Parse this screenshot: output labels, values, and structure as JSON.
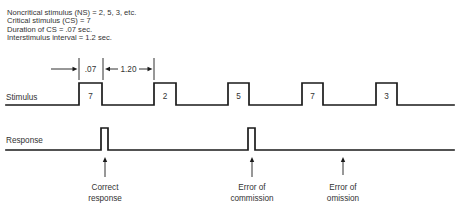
{
  "header": {
    "lines": [
      "Noncritical stimulus (NS) = 2, 5, 3, etc.",
      "Critical stimulus (CS) = 7",
      "Duration of CS = .07 sec.",
      "Interstimulus interval = 1.2 sec."
    ]
  },
  "timing": {
    "duration_label": ".07",
    "interval_label": "1.20"
  },
  "stimulus": {
    "label": "Stimulus",
    "values": [
      "7",
      "2",
      "5",
      "7",
      "3"
    ]
  },
  "response": {
    "label": "Response"
  },
  "annotations": [
    {
      "line1": "Correct",
      "line2": "response"
    },
    {
      "line1": "Error of",
      "line2": "commission"
    },
    {
      "line1": "Error of",
      "line2": "omission"
    }
  ],
  "colors": {
    "line": "#1a1a1a",
    "text": "#333333",
    "background": "#ffffff"
  }
}
